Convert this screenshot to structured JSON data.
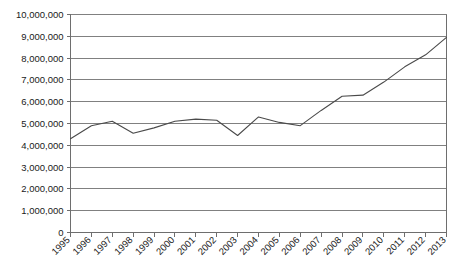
{
  "chart_data": {
    "type": "line",
    "title": "",
    "subtitle": "",
    "xlabel": "",
    "ylabel": "",
    "grid": true,
    "legend": false,
    "legend_position": "none",
    "line_color": "#4a4a4a",
    "gridline_color": "#808080",
    "axis_color": "#6e6e6e",
    "background_color": "#ffffff",
    "xlim": [
      1995,
      2013
    ],
    "ylim": [
      0,
      10000000
    ],
    "ytick_step": 1000000,
    "categories": [
      "1995",
      "1996",
      "1997",
      "1998",
      "1999",
      "2000",
      "2001",
      "2002",
      "2003",
      "2004",
      "2005",
      "2006",
      "2007",
      "2008",
      "2009",
      "2010",
      "2011",
      "2012",
      "2013"
    ],
    "ytick_labels": [
      "10,000,000",
      "9,000,000",
      "8,000,000",
      "7,000,000",
      "6,000,000",
      "5,000,000",
      "4,000,000",
      "3,000,000",
      "2,000,000",
      "1,000,000",
      "0"
    ],
    "ytick_values": [
      10000000,
      9000000,
      8000000,
      7000000,
      6000000,
      5000000,
      4000000,
      3000000,
      2000000,
      1000000,
      0
    ],
    "series": [
      {
        "name": "Series 1",
        "values": [
          4300000,
          4900000,
          5100000,
          4550000,
          4800000,
          5100000,
          5200000,
          5150000,
          4450000,
          5300000,
          5050000,
          4900000,
          5600000,
          6250000,
          6300000,
          6900000,
          7600000,
          8150000,
          8950000
        ]
      }
    ]
  }
}
